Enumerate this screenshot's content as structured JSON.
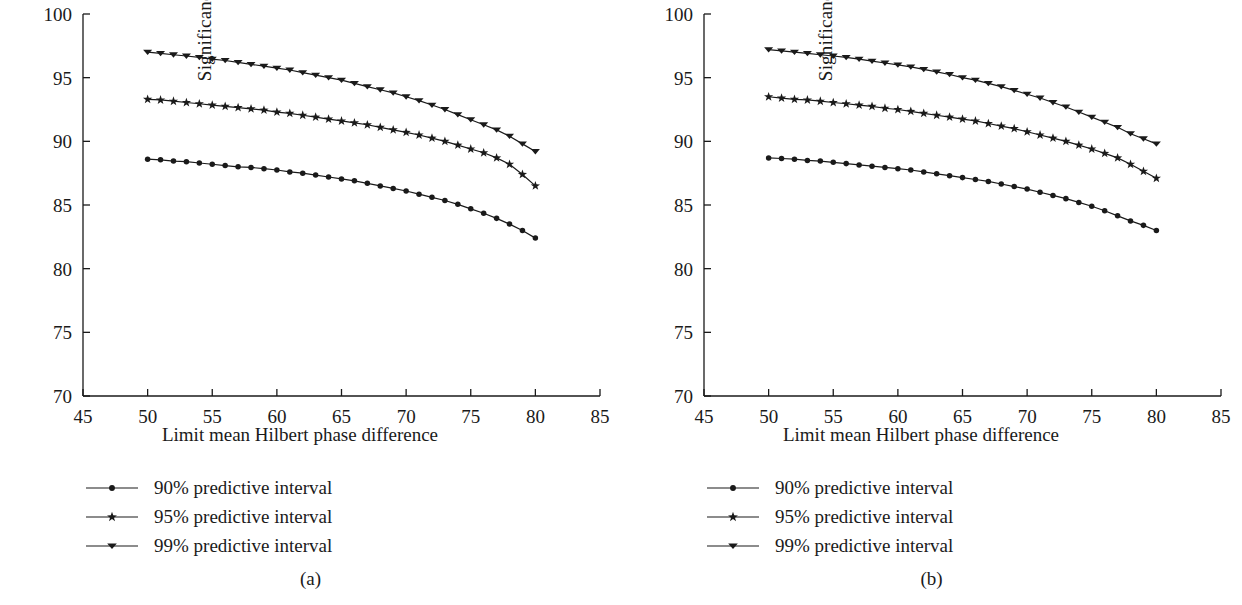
{
  "figure": {
    "background": "#ffffff",
    "ink_color": "#1a1a1a",
    "panel_captions": [
      "(a)",
      "(b)"
    ]
  },
  "legend": {
    "items": [
      {
        "label": "90% predictive interval",
        "marker": "circle-marker"
      },
      {
        "label": "95% predictive interval",
        "marker": "star-marker"
      },
      {
        "label": "99% predictive interval",
        "marker": "triangle-down-marker"
      }
    ]
  },
  "chart_data": [
    {
      "type": "line",
      "panel": "(a)",
      "title": "",
      "xlabel": "Limit mean Hilbert phase difference",
      "ylabel": "Significance scp",
      "xlim": [
        45,
        85
      ],
      "ylim": [
        70,
        100
      ],
      "xticks": [
        45,
        50,
        55,
        60,
        65,
        70,
        75,
        80,
        85
      ],
      "yticks": [
        70,
        75,
        80,
        85,
        90,
        95,
        100
      ],
      "grid": false,
      "legend_position": "below-axes-left",
      "x": [
        50,
        51,
        52,
        53,
        54,
        55,
        56,
        57,
        58,
        59,
        60,
        61,
        62,
        63,
        64,
        65,
        66,
        67,
        68,
        69,
        70,
        71,
        72,
        73,
        74,
        75,
        76,
        77,
        78,
        79,
        80
      ],
      "series": [
        {
          "name": "90% predictive interval",
          "marker": "circle-marker",
          "values": [
            88.6,
            88.55,
            88.45,
            88.4,
            88.3,
            88.2,
            88.1,
            88.0,
            87.95,
            87.85,
            87.75,
            87.6,
            87.5,
            87.35,
            87.2,
            87.05,
            86.9,
            86.7,
            86.5,
            86.3,
            86.1,
            85.85,
            85.6,
            85.35,
            85.05,
            84.7,
            84.35,
            83.95,
            83.5,
            83.0,
            82.4
          ]
        },
        {
          "name": "95% predictive interval",
          "marker": "star-marker",
          "values": [
            93.3,
            93.25,
            93.15,
            93.05,
            92.95,
            92.85,
            92.75,
            92.65,
            92.55,
            92.45,
            92.3,
            92.2,
            92.05,
            91.9,
            91.75,
            91.6,
            91.45,
            91.3,
            91.1,
            90.9,
            90.7,
            90.5,
            90.25,
            90.0,
            89.7,
            89.4,
            89.1,
            88.7,
            88.2,
            87.4,
            86.5
          ]
        },
        {
          "name": "99% predictive interval",
          "marker": "triangle-down-marker",
          "values": [
            97.0,
            96.9,
            96.8,
            96.7,
            96.6,
            96.45,
            96.35,
            96.2,
            96.05,
            95.9,
            95.75,
            95.6,
            95.4,
            95.2,
            95.0,
            94.8,
            94.55,
            94.3,
            94.05,
            93.8,
            93.5,
            93.2,
            92.85,
            92.5,
            92.1,
            91.7,
            91.3,
            90.9,
            90.4,
            89.8,
            89.2
          ]
        }
      ]
    },
    {
      "type": "line",
      "panel": "(b)",
      "title": "",
      "xlabel": "Limit mean Hilbert phase difference",
      "ylabel": "Significance scn",
      "xlim": [
        45,
        85
      ],
      "ylim": [
        70,
        100
      ],
      "xticks": [
        45,
        50,
        55,
        60,
        65,
        70,
        75,
        80,
        85
      ],
      "yticks": [
        70,
        75,
        80,
        85,
        90,
        95,
        100
      ],
      "grid": false,
      "legend_position": "below-axes-left",
      "x": [
        50,
        51,
        52,
        53,
        54,
        55,
        56,
        57,
        58,
        59,
        60,
        61,
        62,
        63,
        64,
        65,
        66,
        67,
        68,
        69,
        70,
        71,
        72,
        73,
        74,
        75,
        76,
        77,
        78,
        79,
        80
      ],
      "series": [
        {
          "name": "90% predictive interval",
          "marker": "circle-marker",
          "values": [
            88.7,
            88.65,
            88.6,
            88.5,
            88.45,
            88.35,
            88.25,
            88.15,
            88.05,
            87.95,
            87.85,
            87.75,
            87.6,
            87.45,
            87.3,
            87.15,
            87.0,
            86.85,
            86.65,
            86.45,
            86.25,
            86.0,
            85.75,
            85.5,
            85.2,
            84.9,
            84.55,
            84.15,
            83.75,
            83.4,
            83.0
          ]
        },
        {
          "name": "95% predictive interval",
          "marker": "star-marker",
          "values": [
            93.5,
            93.4,
            93.3,
            93.25,
            93.15,
            93.05,
            92.95,
            92.85,
            92.75,
            92.6,
            92.5,
            92.35,
            92.2,
            92.05,
            91.9,
            91.75,
            91.6,
            91.4,
            91.2,
            91.0,
            90.75,
            90.5,
            90.25,
            90.0,
            89.7,
            89.4,
            89.05,
            88.7,
            88.2,
            87.65,
            87.1
          ]
        },
        {
          "name": "99% predictive interval",
          "marker": "triangle-down-marker",
          "values": [
            97.2,
            97.1,
            97.0,
            96.9,
            96.8,
            96.7,
            96.6,
            96.45,
            96.3,
            96.15,
            96.0,
            95.85,
            95.65,
            95.45,
            95.25,
            95.0,
            94.8,
            94.55,
            94.3,
            94.0,
            93.7,
            93.4,
            93.05,
            92.7,
            92.3,
            91.9,
            91.5,
            91.1,
            90.6,
            90.2,
            89.8
          ]
        }
      ]
    }
  ]
}
